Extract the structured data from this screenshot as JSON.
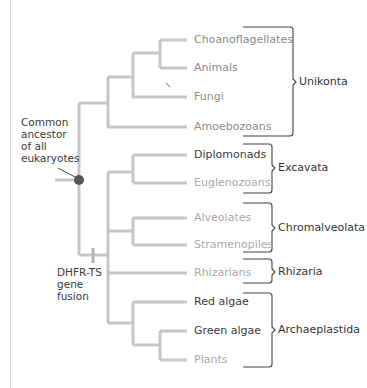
{
  "diagram": {
    "type": "phylogenetic-tree",
    "colors": {
      "branch": "#c6c6c6",
      "node_dot": "#555555",
      "bracket": "#444444",
      "text_dark": "#3a3a3a",
      "text_mid": "#8a8a8a",
      "text_light": "#a8a8a8"
    },
    "annotations": {
      "common_ancestor": [
        "Common",
        "ancestor",
        "of all",
        "eukaryotes"
      ],
      "gene_fusion": [
        "DHFR-TS",
        "gene",
        "fusion"
      ]
    },
    "taxa": [
      {
        "label": "Choanoflagellates",
        "tone": "mid"
      },
      {
        "label": "Animals",
        "tone": "mid"
      },
      {
        "label": "Fungi",
        "tone": "mid"
      },
      {
        "label": "Amoebozoans",
        "tone": "mid"
      },
      {
        "label": "Diplomonads",
        "tone": "dark"
      },
      {
        "label": "Euglenozoans",
        "tone": "light"
      },
      {
        "label": "Alveolates",
        "tone": "light"
      },
      {
        "label": "Stramenopiles",
        "tone": "light"
      },
      {
        "label": "Rhizarians",
        "tone": "light"
      },
      {
        "label": "Red algae",
        "tone": "dark"
      },
      {
        "label": "Green algae",
        "tone": "dark"
      },
      {
        "label": "Plants",
        "tone": "light"
      }
    ],
    "groups": [
      {
        "label": "Unikonta",
        "members": [
          "Choanoflagellates",
          "Animals",
          "Fungi",
          "Amoebozoans"
        ]
      },
      {
        "label": "Excavata",
        "members": [
          "Diplomonads",
          "Euglenozoans"
        ]
      },
      {
        "label": "Chromalveolata",
        "members": [
          "Alveolates",
          "Stramenopiles"
        ]
      },
      {
        "label": "Rhizaria",
        "members": [
          "Rhizarians"
        ]
      },
      {
        "label": "Archaeplastida",
        "members": [
          "Red algae",
          "Green algae",
          "Plants"
        ]
      }
    ]
  }
}
